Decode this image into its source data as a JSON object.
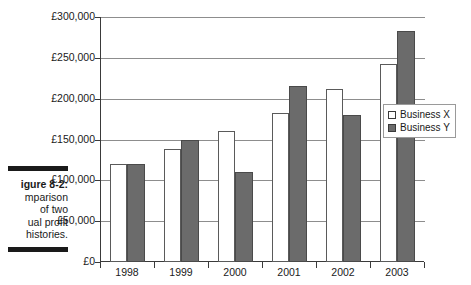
{
  "caption": {
    "figure_label": "igure 8-2:",
    "lines": [
      "mparison",
      "of two",
      "ual profit",
      "histories."
    ]
  },
  "legend": {
    "position": "right-middle",
    "entries": [
      {
        "label": "Business X",
        "swatch": "hollow-square-icon",
        "color": "#ffffff"
      },
      {
        "label": "Business Y",
        "swatch": "filled-square-icon",
        "color": "#6b6b6b"
      }
    ]
  },
  "chart_data": {
    "type": "bar",
    "title": "",
    "subtitle": "",
    "xlabel": "",
    "ylabel": "",
    "categories": [
      "1998",
      "1999",
      "2000",
      "2001",
      "2002",
      "2003"
    ],
    "series": [
      {
        "name": "Business X",
        "color": "#ffffff",
        "values": [
          120000,
          138000,
          160000,
          182000,
          212000,
          242000
        ]
      },
      {
        "name": "Business Y",
        "color": "#6b6b6b",
        "values": [
          120000,
          150000,
          110000,
          215000,
          180000,
          283000
        ]
      }
    ],
    "ylim": [
      0,
      300000
    ],
    "ytick_values": [
      0,
      50000,
      100000,
      150000,
      200000,
      250000,
      300000
    ],
    "ytick_labels": [
      "£0",
      "£50,000",
      "£100,000",
      "£150,000",
      "£200,000",
      "£250,000",
      "£300,000"
    ],
    "grid": true,
    "grid_axis": "y",
    "legend_position": "right"
  }
}
